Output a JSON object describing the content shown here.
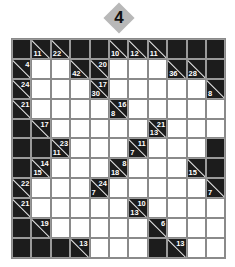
{
  "puzzle": {
    "number": "4",
    "rows": 11,
    "cols": 11,
    "cells": [
      [
        "X",
        {
          "down": "11"
        },
        {
          "down": "22"
        },
        "X",
        "X",
        {
          "down": "10"
        },
        {
          "down": "12"
        },
        {
          "down": "11"
        },
        "X",
        "X",
        "X"
      ],
      [
        {
          "across": "4"
        },
        "",
        "",
        {
          "down": "42"
        },
        {
          "across": "20"
        },
        "",
        "",
        "",
        {
          "down": "36"
        },
        {
          "down": "28"
        },
        "X"
      ],
      [
        {
          "across": "24"
        },
        "",
        "",
        "",
        {
          "across": "17",
          "down": "30"
        },
        "",
        "",
        "",
        "",
        "",
        {
          "down": "8"
        }
      ],
      [
        {
          "across": "21"
        },
        "",
        "",
        "",
        "",
        {
          "across": "16",
          "down": "8"
        },
        "",
        "",
        "",
        "",
        ""
      ],
      [
        "X",
        {
          "across": "17"
        },
        "",
        "",
        "",
        "",
        "",
        {
          "across": "21",
          "down": "13"
        },
        "",
        "",
        ""
      ],
      [
        "X",
        "X",
        {
          "across": "23",
          "down": "11"
        },
        "",
        "",
        "",
        {
          "across": "11",
          "down": "7"
        },
        "",
        "",
        "",
        "X"
      ],
      [
        "X",
        {
          "across": "14",
          "down": "15"
        },
        "",
        "",
        "",
        {
          "across": "8",
          "down": "18"
        },
        "",
        "",
        "",
        {
          "down": "15"
        },
        "X"
      ],
      [
        {
          "across": "22"
        },
        "",
        "",
        "",
        {
          "across": "24",
          "down": "7"
        },
        "",
        "",
        "",
        "",
        "",
        {
          "down": "7"
        }
      ],
      [
        {
          "across": "21"
        },
        "",
        "",
        "",
        "",
        "",
        {
          "across": "10",
          "down": "13"
        },
        "",
        "",
        "",
        ""
      ],
      [
        "X",
        {
          "across": "19"
        },
        "",
        "",
        "",
        "",
        "",
        {
          "across": "6"
        },
        "",
        "",
        ""
      ],
      [
        "X",
        "X",
        "X",
        {
          "across": "13"
        },
        "",
        "",
        "",
        "X",
        {
          "across": "13"
        },
        "",
        ""
      ]
    ]
  },
  "colors": {
    "badge": "#b8b8b8",
    "block": "#1c1c1c",
    "grid_line": "#8a8a8a",
    "empty": "#ffffff"
  }
}
